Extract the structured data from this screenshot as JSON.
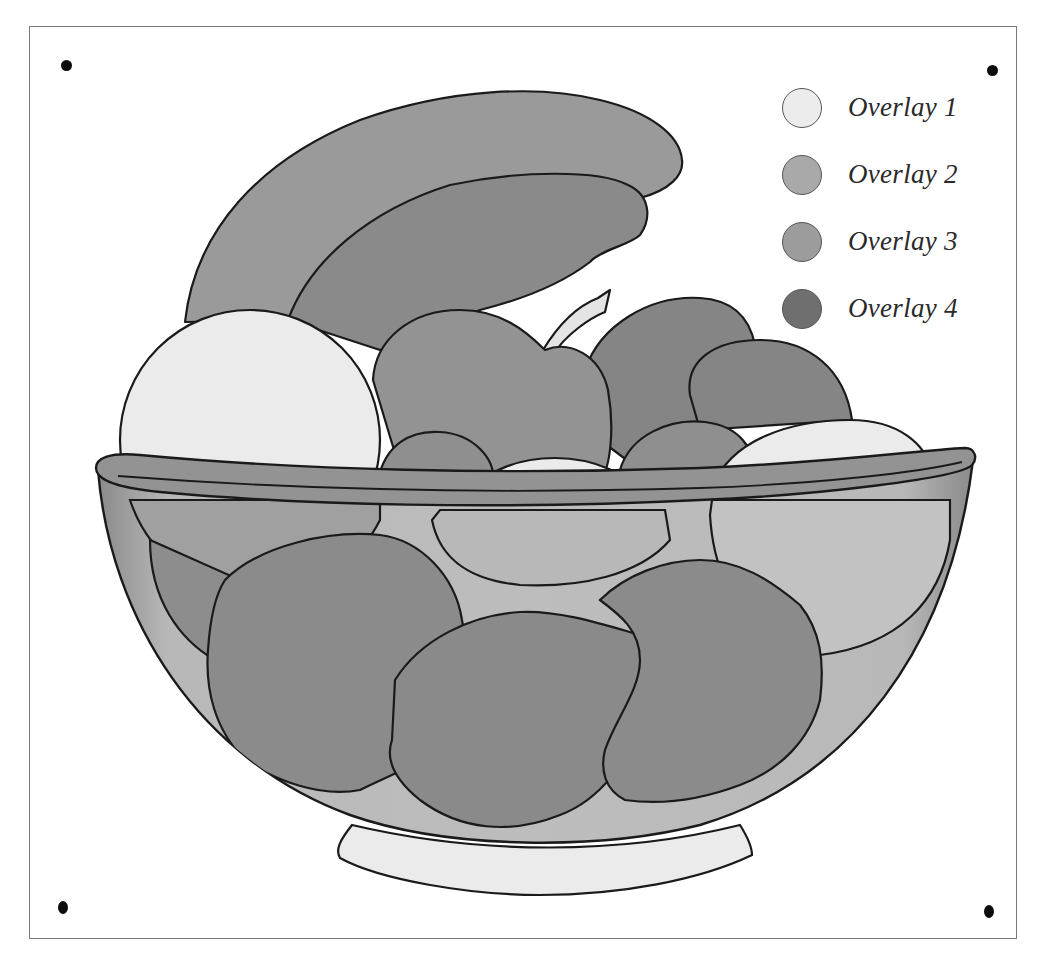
{
  "figure": {
    "frame_color": "#7a7a7a",
    "outline_color": "#1a1a1a"
  },
  "registration_marks": [
    {
      "position": "top-left",
      "x": 66,
      "y": 65
    },
    {
      "position": "top-right",
      "x": 992,
      "y": 70
    },
    {
      "position": "bottom-left",
      "x": 63,
      "y": 907
    },
    {
      "position": "bottom-right",
      "x": 989,
      "y": 911
    }
  ],
  "legend": {
    "items": [
      {
        "label": "Overlay 1",
        "color": "#ececec"
      },
      {
        "label": "Overlay 2",
        "color": "#a9a9a9"
      },
      {
        "label": "Overlay 3",
        "color": "#9c9c9c"
      },
      {
        "label": "Overlay 4",
        "color": "#6f6f6f"
      }
    ]
  },
  "palette": {
    "overlay_1": "#ececec",
    "overlay_2": "#a9a9a9",
    "overlay_3": "#9a9a9a",
    "overlay_4": "#767676",
    "bowl": "#8e8e8e",
    "bowl_highlight": "#c9c9c9"
  }
}
